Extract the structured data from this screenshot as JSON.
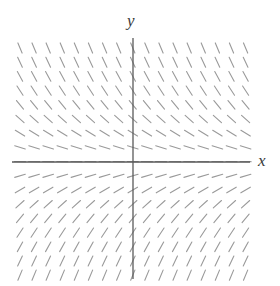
{
  "figure": {
    "type": "slope-field",
    "background_color": "#ffffff"
  },
  "axes": {
    "x_axis": {
      "label": "x",
      "color": "#5a5a5a",
      "line_width": 1.3,
      "x_start_px": 12,
      "x_end_px": 250,
      "y_px": 162
    },
    "y_axis": {
      "label": "y",
      "color": "#5a5a5a",
      "line_width": 1.3,
      "y_start_px": 38,
      "y_end_px": 279,
      "x_px": 133
    },
    "origin_px": [
      133,
      162
    ]
  },
  "chart_data": {
    "type": "slope-field",
    "title": "",
    "xlabel": "x",
    "ylabel": "y",
    "equation": "dy/dx = -y",
    "grid": {
      "x_start_px": 20,
      "x_step_px": 14.1,
      "x_count": 17,
      "y_start_px": 48,
      "y_step_px": 14.2,
      "y_count": 17
    },
    "segment": {
      "length_px": 11,
      "color": "#9a9a9a",
      "line_width": 1.1
    },
    "scale": {
      "pixels_per_unit_x": 47,
      "pixels_per_unit_y": 47,
      "x_range": [
        -2.4,
        2.4
      ],
      "y_range": [
        -2.4,
        2.4
      ]
    },
    "slope_by_row": [
      {
        "y": 2.41,
        "slope": -2.41
      },
      {
        "y": 2.11,
        "slope": -2.11
      },
      {
        "y": 1.81,
        "slope": -1.81
      },
      {
        "y": 1.51,
        "slope": -1.51
      },
      {
        "y": 1.21,
        "slope": -1.21
      },
      {
        "y": 0.9,
        "slope": -0.9
      },
      {
        "y": 0.6,
        "slope": -0.6
      },
      {
        "y": 0.3,
        "slope": -0.3
      },
      {
        "y": 0.0,
        "slope": 0.0
      },
      {
        "y": -0.3,
        "slope": 0.3
      },
      {
        "y": -0.6,
        "slope": 0.6
      },
      {
        "y": -0.9,
        "slope": 0.9
      },
      {
        "y": -1.21,
        "slope": 1.21
      },
      {
        "y": -1.51,
        "slope": 1.51
      },
      {
        "y": -1.81,
        "slope": 1.81
      },
      {
        "y": -2.11,
        "slope": 2.11
      },
      {
        "y": -2.41,
        "slope": 2.41
      }
    ]
  }
}
